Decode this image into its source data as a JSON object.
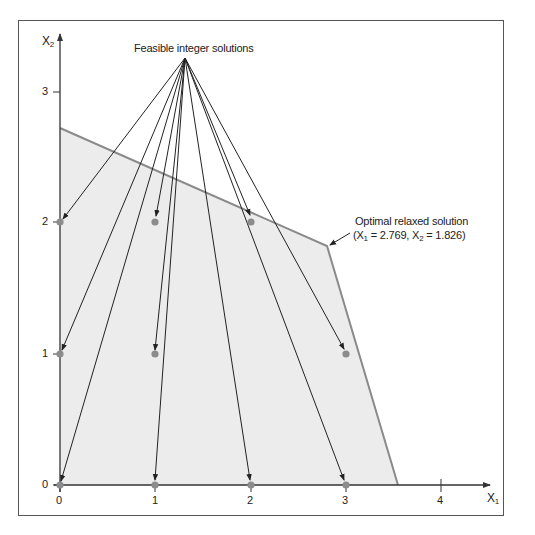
{
  "figure": {
    "y_axis_label": "X",
    "y_axis_sub": "2",
    "x_axis_label": "X",
    "x_axis_sub": "1",
    "x_ticks": [
      "0",
      "1",
      "2",
      "3",
      "4"
    ],
    "y_ticks": [
      "0",
      "1",
      "2",
      "3"
    ],
    "annotation_feasible": "Feasible integer solutions",
    "annotation_optimal_line1": "Optimal relaxed solution",
    "annotation_optimal_line2_pre": "(X",
    "annotation_optimal_sub1": "1",
    "annotation_optimal_mid": " = 2.769, X",
    "annotation_optimal_sub2": "2",
    "annotation_optimal_post": " = 1.826)",
    "colors": {
      "feasible_region_fill": "#ececec",
      "boundary": "#8a8a8a",
      "points": "#8c8c8c",
      "arrows": "#222222",
      "axes": "#333333",
      "frame": "#555555"
    }
  },
  "diagram_data": {
    "type": "linear-programming-feasible-region",
    "feasible_region_vertices": [
      [
        0,
        2.72
      ],
      [
        2.769,
        1.826
      ],
      [
        3.54,
        0
      ],
      [
        0,
        0
      ]
    ],
    "optimal_relaxed_solution": {
      "x1": 2.769,
      "x2": 1.826
    },
    "feasible_integer_points": [
      [
        0,
        2
      ],
      [
        1,
        2
      ],
      [
        2,
        2
      ],
      [
        0,
        1
      ],
      [
        1,
        1
      ],
      [
        3,
        1
      ],
      [
        0,
        0
      ],
      [
        1,
        0
      ],
      [
        2,
        0
      ],
      [
        3,
        0
      ]
    ],
    "x_range": [
      0,
      4
    ],
    "y_range": [
      0,
      3
    ]
  }
}
